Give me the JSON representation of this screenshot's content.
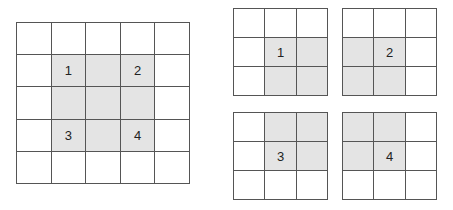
{
  "diagram": {
    "big_grid": {
      "rows": 5,
      "cols": 5,
      "shaded": [
        [
          1,
          1
        ],
        [
          1,
          2
        ],
        [
          1,
          3
        ],
        [
          2,
          1
        ],
        [
          2,
          2
        ],
        [
          2,
          3
        ],
        [
          3,
          1
        ],
        [
          3,
          2
        ],
        [
          3,
          3
        ]
      ],
      "labels": [
        {
          "row": 1,
          "col": 1,
          "text": "1"
        },
        {
          "row": 1,
          "col": 3,
          "text": "2"
        },
        {
          "row": 3,
          "col": 1,
          "text": "3"
        },
        {
          "row": 3,
          "col": 3,
          "text": "4"
        }
      ]
    },
    "small_grids": [
      {
        "id": "1",
        "rows": 3,
        "cols": 3,
        "shaded": [
          [
            1,
            1
          ],
          [
            1,
            2
          ],
          [
            2,
            1
          ],
          [
            2,
            2
          ]
        ],
        "label": {
          "row": 1,
          "col": 1,
          "text": "1"
        }
      },
      {
        "id": "2",
        "rows": 3,
        "cols": 3,
        "shaded": [
          [
            1,
            0
          ],
          [
            1,
            1
          ],
          [
            2,
            0
          ],
          [
            2,
            1
          ]
        ],
        "label": {
          "row": 1,
          "col": 1,
          "text": "2"
        }
      },
      {
        "id": "3",
        "rows": 3,
        "cols": 3,
        "shaded": [
          [
            0,
            1
          ],
          [
            0,
            2
          ],
          [
            1,
            1
          ],
          [
            1,
            2
          ]
        ],
        "label": {
          "row": 1,
          "col": 1,
          "text": "3"
        }
      },
      {
        "id": "4",
        "rows": 3,
        "cols": 3,
        "shaded": [
          [
            0,
            0
          ],
          [
            0,
            1
          ],
          [
            1,
            0
          ],
          [
            1,
            1
          ]
        ],
        "label": {
          "row": 1,
          "col": 1,
          "text": "4"
        }
      }
    ],
    "colors": {
      "line": "#555555",
      "shade": "#e4e4e4",
      "background": "#ffffff",
      "text": "#222222"
    }
  }
}
